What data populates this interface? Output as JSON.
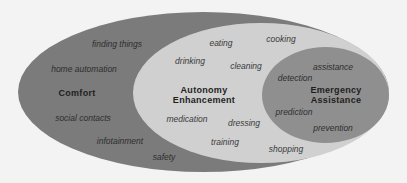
{
  "diagram": {
    "type": "nested-ellipses",
    "colors": {
      "background": "#f3f3f3",
      "outer": "#7b7b7b",
      "middle": "#d0d0d0",
      "inner": "#8f8f8f"
    },
    "regions": {
      "comfort": {
        "title": "Comfort",
        "items": [
          "finding things",
          "home automation",
          "social contacts",
          "infotainment",
          "safety"
        ]
      },
      "autonomy": {
        "title_line1": "Autonomy",
        "title_line2": "Enhancement",
        "items": [
          "eating",
          "cooking",
          "drinking",
          "cleaning",
          "medication",
          "dressing",
          "training",
          "shopping"
        ]
      },
      "emergency": {
        "title_line1": "Emergency",
        "title_line2": "Assistance",
        "items": [
          "assistance",
          "detection",
          "prediction",
          "prevention"
        ]
      }
    }
  }
}
